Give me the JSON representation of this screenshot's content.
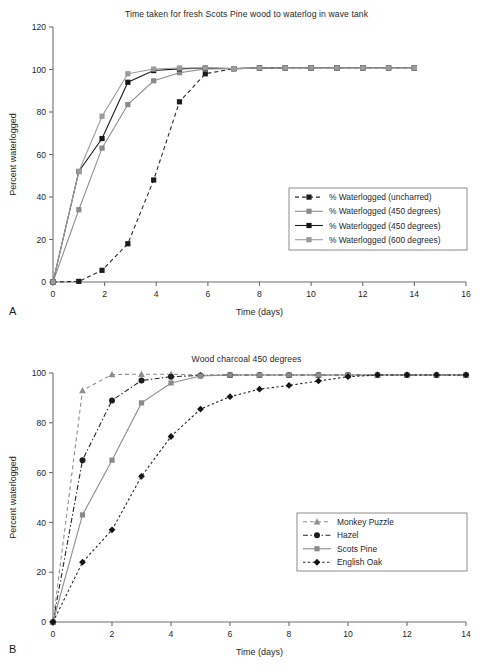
{
  "figure": {
    "panels": [
      {
        "id": "A",
        "label": "A",
        "title": "Time taken for fresh Scots Pine wood to waterlog in wave tank"
      },
      {
        "id": "B",
        "label": "B",
        "title": "Wood charcoal 450 degrees"
      }
    ]
  },
  "chart_data": [
    {
      "type": "line",
      "panel": "A",
      "title": "Time taken for fresh Scots Pine wood to waterlog in wave tank",
      "xlabel": "Time (days)",
      "ylabel": "Percent  waterlogged",
      "xlim": [
        0,
        16
      ],
      "ylim": [
        0,
        120
      ],
      "xticks": [
        0,
        2,
        4,
        6,
        8,
        10,
        12,
        14,
        16
      ],
      "yticks": [
        0,
        20,
        40,
        60,
        80,
        100,
        120
      ],
      "xtick_labels": [
        "0",
        "2",
        "4",
        "6",
        "8",
        "10",
        "12",
        "14",
        "16"
      ],
      "ytick_labels": [
        "0",
        "20",
        "40",
        "60",
        "80",
        "100",
        "120"
      ],
      "grid": false,
      "legend_position": "lower-right",
      "series": [
        {
          "name": "% Waterlogged (uncharred)",
          "marker": "square",
          "marker_color": "#1c1c1c",
          "line_color": "#2b2b2b",
          "line_style": "dashed",
          "x": [
            0,
            1,
            1.9,
            2.9,
            3.9,
            4.9,
            5.9,
            7,
            8,
            9,
            10,
            11,
            12,
            13,
            14
          ],
          "y": [
            0,
            0.3,
            5.5,
            18,
            48,
            84.8,
            98,
            100.4,
            100.7,
            100.8,
            100.8,
            100.8,
            100.8,
            100.8,
            100.8
          ]
        },
        {
          "name": "% Waterlogged (450 degrees)",
          "marker": "square",
          "marker_color": "#8a8a8a",
          "line_color": "#8f8f8f",
          "line_style": "solid",
          "x": [
            0,
            1,
            1.9,
            2.9,
            3.9,
            4.9,
            5.9,
            7,
            8,
            9,
            10,
            11,
            12,
            13,
            14
          ],
          "y": [
            0,
            34,
            63,
            83.5,
            94.7,
            98.5,
            100.3,
            100.4,
            100.7,
            100.8,
            100.8,
            100.8,
            100.8,
            100.8,
            100.8
          ]
        },
        {
          "name": "% Waterlogged (450 degrees)",
          "marker": "square",
          "marker_color": "#161616",
          "line_color": "#1f1f1f",
          "line_style": "solid",
          "x": [
            0,
            1,
            1.9,
            2.9,
            3.9,
            4.9,
            5.9,
            7,
            8,
            9,
            10,
            11,
            12,
            13,
            14
          ],
          "y": [
            0,
            52,
            67.5,
            94,
            99.5,
            100.3,
            100.7,
            100.4,
            100.7,
            100.8,
            100.8,
            100.8,
            100.8,
            100.8,
            100.8
          ]
        },
        {
          "name": "% Waterlogged (600 degrees)",
          "marker": "square",
          "marker_color": "#9a9a9a",
          "line_color": "#9e9e9e",
          "line_style": "solid",
          "x": [
            0,
            1,
            1.9,
            2.9,
            3.9,
            4.9,
            5.9,
            7,
            8,
            9,
            10,
            11,
            12,
            13,
            14
          ],
          "y": [
            0,
            52,
            78,
            98,
            100.2,
            100.7,
            100.8,
            100.4,
            100.7,
            100.8,
            100.8,
            100.8,
            100.8,
            100.8,
            100.8
          ]
        }
      ]
    },
    {
      "type": "line",
      "panel": "B",
      "title": "Wood charcoal 450 degrees",
      "xlabel": "Time (days)",
      "ylabel": "Percent  waterlogged",
      "xlim": [
        0,
        14
      ],
      "ylim": [
        0,
        100
      ],
      "xticks": [
        0,
        2,
        4,
        6,
        8,
        10,
        12,
        14
      ],
      "yticks": [
        0,
        20,
        40,
        60,
        80,
        100
      ],
      "xtick_labels": [
        "0",
        "2",
        "4",
        "6",
        "8",
        "10",
        "12",
        "14"
      ],
      "ytick_labels": [
        "0",
        "20",
        "40",
        "60",
        "80",
        "100"
      ],
      "grid": false,
      "legend_position": "lower-right",
      "series": [
        {
          "name": "Monkey Puzzle",
          "marker": "triangle",
          "marker_color": "#8d8d8d",
          "line_color": "#909090",
          "line_style": "dashed",
          "x": [
            0,
            1,
            2,
            3,
            4,
            5,
            6,
            7,
            8,
            9,
            10,
            11,
            12,
            13,
            14
          ],
          "y": [
            0,
            93,
            99.4,
            99.5,
            99.5,
            99.2,
            99.2,
            99.2,
            99.2,
            99.2,
            99.2,
            99.2,
            99.2,
            99.2,
            99.2
          ]
        },
        {
          "name": "Hazel",
          "marker": "circle",
          "marker_color": "#1c1c1c",
          "line_color": "#262626",
          "line_style": "dashdot",
          "x": [
            0,
            1,
            2,
            3,
            4,
            5,
            6,
            7,
            8,
            9,
            10,
            11,
            12,
            13,
            14
          ],
          "y": [
            0,
            65,
            89,
            97,
            98.5,
            99,
            99.2,
            99.2,
            99.2,
            99.2,
            99.2,
            99.2,
            99.2,
            99.2,
            99.2
          ]
        },
        {
          "name": "Scots Pine",
          "marker": "square",
          "marker_color": "#8a8a8a",
          "line_color": "#8d8d8d",
          "line_style": "solid",
          "x": [
            0,
            1,
            2,
            3,
            4,
            5,
            6,
            7,
            8,
            9,
            10,
            11,
            12,
            13,
            14
          ],
          "y": [
            0,
            43,
            65,
            88,
            96,
            98.8,
            99.2,
            99.2,
            99.2,
            99.2,
            99.2,
            99.2,
            99.2,
            99.2,
            99.2
          ]
        },
        {
          "name": "English Oak",
          "marker": "diamond",
          "marker_color": "#141414",
          "line_color": "#242424",
          "line_style": "dotted",
          "x": [
            0,
            1,
            2,
            3,
            4,
            5,
            6,
            7,
            8,
            9,
            10,
            11,
            12,
            13,
            14
          ],
          "y": [
            0,
            24,
            37,
            58.5,
            74.5,
            85.5,
            90.5,
            93.5,
            95,
            96.8,
            98.5,
            99.2,
            99.2,
            99.2,
            99.2
          ]
        }
      ]
    }
  ]
}
